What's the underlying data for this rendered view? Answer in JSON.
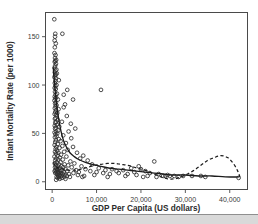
{
  "chart_data": {
    "type": "scatter",
    "title": "",
    "xlabel": "GDP Per Capita (US dollars)",
    "ylabel": "Infant Mortality Rate (per 1000)",
    "xlim": [
      -1500,
      44000
    ],
    "ylim": [
      -8,
      175
    ],
    "xticks": [
      0,
      10000,
      20000,
      30000,
      40000
    ],
    "xticklabels": [
      "0",
      "10,000",
      "20,000",
      "30,000",
      "40,000"
    ],
    "yticks": [
      0,
      50,
      100,
      150
    ],
    "yticklabels": [
      "0",
      "50",
      "100",
      "150"
    ],
    "grid": false,
    "legend": false,
    "marker": "open-circle",
    "marker_color": "#2e2e2e",
    "points": [
      [
        480,
        168
      ],
      [
        700,
        153
      ],
      [
        2300,
        153
      ],
      [
        650,
        150
      ],
      [
        560,
        146
      ],
      [
        820,
        143
      ],
      [
        600,
        139
      ],
      [
        520,
        133
      ],
      [
        760,
        131
      ],
      [
        640,
        128
      ],
      [
        900,
        126
      ],
      [
        700,
        125
      ],
      [
        580,
        124
      ],
      [
        860,
        122
      ],
      [
        680,
        120
      ],
      [
        540,
        118
      ],
      [
        950,
        116
      ],
      [
        720,
        115
      ],
      [
        600,
        113
      ],
      [
        1050,
        112
      ],
      [
        800,
        111
      ],
      [
        660,
        110
      ],
      [
        520,
        108
      ],
      [
        880,
        107
      ],
      [
        1500,
        105
      ],
      [
        740,
        104
      ],
      [
        600,
        102
      ],
      [
        980,
        100
      ],
      [
        700,
        99
      ],
      [
        560,
        97
      ],
      [
        820,
        96
      ],
      [
        3400,
        95
      ],
      [
        11000,
        95
      ],
      [
        640,
        93
      ],
      [
        1100,
        91
      ],
      [
        760,
        90
      ],
      [
        2600,
        90
      ],
      [
        580,
        88
      ],
      [
        900,
        87
      ],
      [
        700,
        86
      ],
      [
        1300,
        85
      ],
      [
        4700,
        85
      ],
      [
        520,
        84
      ],
      [
        840,
        82
      ],
      [
        660,
        81
      ],
      [
        2900,
        80
      ],
      [
        1000,
        79
      ],
      [
        760,
        78
      ],
      [
        2600,
        77
      ],
      [
        600,
        76
      ],
      [
        1450,
        75
      ],
      [
        880,
        74
      ],
      [
        700,
        72
      ],
      [
        1150,
        71
      ],
      [
        560,
        70
      ],
      [
        940,
        69
      ],
      [
        3300,
        68
      ],
      [
        780,
        66
      ],
      [
        620,
        65
      ],
      [
        1250,
        64
      ],
      [
        860,
        62
      ],
      [
        2200,
        62
      ],
      [
        700,
        61
      ],
      [
        4200,
        60
      ],
      [
        1050,
        59
      ],
      [
        580,
        58
      ],
      [
        1600,
        57
      ],
      [
        820,
        56
      ],
      [
        5200,
        55
      ],
      [
        660,
        55
      ],
      [
        1350,
        53
      ],
      [
        900,
        52
      ],
      [
        3700,
        52
      ],
      [
        540,
        51
      ],
      [
        1150,
        50
      ],
      [
        740,
        49
      ],
      [
        2500,
        48
      ],
      [
        980,
        47
      ],
      [
        620,
        46
      ],
      [
        4300,
        45
      ],
      [
        1500,
        44
      ],
      [
        840,
        43
      ],
      [
        1900,
        42
      ],
      [
        700,
        41
      ],
      [
        3100,
        40
      ],
      [
        1250,
        39
      ],
      [
        560,
        38
      ],
      [
        2300,
        37
      ],
      [
        920,
        36
      ],
      [
        4700,
        36
      ],
      [
        1650,
        35
      ],
      [
        780,
        34
      ],
      [
        3500,
        33
      ],
      [
        1100,
        32
      ],
      [
        640,
        31
      ],
      [
        2700,
        31
      ],
      [
        1400,
        30
      ],
      [
        5600,
        30
      ],
      [
        860,
        29
      ],
      [
        2000,
        28
      ],
      [
        7000,
        27
      ],
      [
        1200,
        27
      ],
      [
        520,
        26
      ],
      [
        3200,
        26
      ],
      [
        1700,
        25
      ],
      [
        900,
        24
      ],
      [
        6300,
        24
      ],
      [
        2400,
        23
      ],
      [
        1350,
        23
      ],
      [
        700,
        22
      ],
      [
        8000,
        22
      ],
      [
        23000,
        21
      ],
      [
        4100,
        21
      ],
      [
        1900,
        20
      ],
      [
        1050,
        20
      ],
      [
        580,
        19
      ],
      [
        5000,
        19
      ],
      [
        2800,
        18
      ],
      [
        1500,
        18
      ],
      [
        9000,
        18
      ],
      [
        800,
        17
      ],
      [
        3600,
        17
      ],
      [
        2100,
        16
      ],
      [
        1250,
        16
      ],
      [
        6600,
        16
      ],
      [
        19500,
        16
      ],
      [
        640,
        15
      ],
      [
        4400,
        15
      ],
      [
        2500,
        15
      ],
      [
        1650,
        14
      ],
      [
        10500,
        14
      ],
      [
        17800,
        14
      ],
      [
        950,
        14
      ],
      [
        7500,
        13
      ],
      [
        3000,
        13
      ],
      [
        1400,
        13
      ],
      [
        13500,
        13
      ],
      [
        20000,
        13
      ],
      [
        760,
        12
      ],
      [
        5400,
        12
      ],
      [
        2200,
        12
      ],
      [
        1100,
        12
      ],
      [
        12000,
        12
      ],
      [
        16000,
        12
      ],
      [
        8600,
        11
      ],
      [
        3400,
        11
      ],
      [
        1800,
        11
      ],
      [
        560,
        11
      ],
      [
        14500,
        11
      ],
      [
        21000,
        11
      ],
      [
        6000,
        10
      ],
      [
        2600,
        10
      ],
      [
        1300,
        10
      ],
      [
        900,
        10
      ],
      [
        10000,
        10
      ],
      [
        18500,
        10
      ],
      [
        4800,
        9
      ],
      [
        2000,
        9
      ],
      [
        1500,
        9
      ],
      [
        700,
        9
      ],
      [
        11500,
        9
      ],
      [
        15000,
        9
      ],
      [
        22000,
        9
      ],
      [
        3800,
        8
      ],
      [
        2400,
        8
      ],
      [
        1150,
        8
      ],
      [
        13000,
        8
      ],
      [
        17000,
        8
      ],
      [
        24000,
        8
      ],
      [
        26000,
        7
      ],
      [
        5800,
        7
      ],
      [
        2900,
        7
      ],
      [
        1700,
        7
      ],
      [
        9500,
        7
      ],
      [
        19000,
        7
      ],
      [
        25000,
        6
      ],
      [
        27500,
        6
      ],
      [
        7200,
        6
      ],
      [
        3300,
        6
      ],
      [
        2100,
        6
      ],
      [
        1350,
        6
      ],
      [
        16500,
        6
      ],
      [
        21500,
        6
      ],
      [
        25500,
        6
      ],
      [
        26500,
        6
      ],
      [
        29500,
        6
      ],
      [
        31500,
        6
      ],
      [
        33500,
        6
      ],
      [
        34500,
        5
      ],
      [
        28500,
        5
      ],
      [
        23500,
        5
      ],
      [
        20500,
        5
      ],
      [
        12500,
        5
      ],
      [
        6800,
        5
      ],
      [
        4000,
        5
      ],
      [
        2700,
        5
      ],
      [
        1600,
        5
      ],
      [
        1000,
        5
      ],
      [
        42000,
        4
      ],
      [
        1250,
        4
      ],
      [
        2200,
        4
      ],
      [
        3000,
        3
      ],
      [
        1700,
        3
      ],
      [
        900,
        2
      ]
    ],
    "solid_fit": {
      "label": "regression fit",
      "style": "solid",
      "points": [
        [
          250,
          118
        ],
        [
          600,
          98
        ],
        [
          1000,
          80
        ],
        [
          1500,
          64
        ],
        [
          2000,
          52
        ],
        [
          2600,
          42
        ],
        [
          3200,
          36
        ],
        [
          4000,
          30
        ],
        [
          5000,
          26
        ],
        [
          6000,
          23
        ],
        [
          7500,
          20
        ],
        [
          9000,
          18
        ],
        [
          11000,
          16
        ],
        [
          13000,
          14
        ],
        [
          15000,
          13
        ],
        [
          17000,
          12
        ],
        [
          19000,
          11
        ],
        [
          21000,
          10
        ],
        [
          23000,
          9
        ],
        [
          25000,
          8
        ],
        [
          27000,
          7
        ],
        [
          30000,
          7
        ],
        [
          33000,
          6
        ],
        [
          36000,
          6
        ],
        [
          39000,
          5
        ],
        [
          42000,
          5
        ]
      ]
    },
    "dashed_fit": {
      "label": "lowess / spline fit",
      "style": "dashed",
      "points": [
        [
          250,
          20
        ],
        [
          800,
          16
        ],
        [
          1500,
          14
        ],
        [
          2400,
          13
        ],
        [
          3500,
          12
        ],
        [
          5000,
          12
        ],
        [
          6500,
          13
        ],
        [
          8000,
          15
        ],
        [
          9500,
          17
        ],
        [
          11000,
          18
        ],
        [
          12500,
          19
        ],
        [
          14000,
          19
        ],
        [
          15500,
          18
        ],
        [
          17000,
          17
        ],
        [
          18500,
          15
        ],
        [
          20000,
          13
        ],
        [
          21500,
          11
        ],
        [
          23000,
          8
        ],
        [
          24500,
          5
        ],
        [
          26000,
          3
        ],
        [
          27500,
          3
        ],
        [
          29000,
          5
        ],
        [
          30500,
          8
        ],
        [
          32000,
          12
        ],
        [
          33500,
          17
        ],
        [
          35000,
          22
        ],
        [
          36500,
          25
        ],
        [
          38000,
          27
        ],
        [
          39500,
          25
        ],
        [
          40800,
          19
        ],
        [
          41800,
          11
        ],
        [
          42300,
          5
        ]
      ]
    }
  }
}
